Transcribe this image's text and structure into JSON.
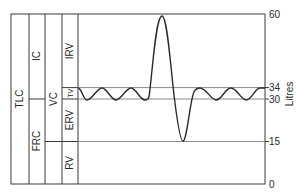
{
  "figure": {
    "type": "lung-volume-spirogram",
    "y_axis": {
      "label": "Litres",
      "ticks": [
        "60",
        "34",
        "30",
        "15",
        "0"
      ],
      "tick_values": [
        60,
        34,
        30,
        15,
        0
      ],
      "range": [
        0,
        60
      ]
    },
    "columns": [
      {
        "name": "total",
        "segments": [
          {
            "label": "TLC",
            "from": 0,
            "to": 60
          }
        ]
      },
      {
        "name": "capacities",
        "segments": [
          {
            "label": "IC",
            "from": 30,
            "to": 60
          },
          {
            "label": "FRC",
            "from": 0,
            "to": 30
          }
        ]
      },
      {
        "name": "vital",
        "segments": [
          {
            "label": "VC",
            "from": 15,
            "to": 60
          }
        ]
      },
      {
        "name": "volumes",
        "segments": [
          {
            "label": "IRV",
            "from": 34,
            "to": 60
          },
          {
            "label": "TV",
            "from": 30,
            "to": 34
          },
          {
            "label": "ERV",
            "from": 15,
            "to": 30
          },
          {
            "label": "RV",
            "from": 0,
            "to": 15
          }
        ]
      }
    ],
    "reference_levels": [
      34,
      30,
      15
    ],
    "trace": {
      "description": "Tidal breathing oscillating between 30 and 34 L, then maximal inspiration to 60 L, maximal expiration to 15 L, then tidal breathing resumes",
      "tidal_min": 30,
      "tidal_max": 34,
      "max_inspiration": 60,
      "max_expiration": 15
    }
  }
}
